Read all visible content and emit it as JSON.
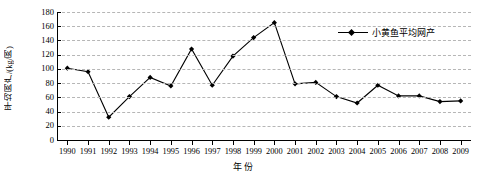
{
  "chart_data": {
    "type": "line",
    "title": "",
    "xlabel": "年份",
    "ylabel": "平均网产/(kg/网)",
    "ylim": [
      0,
      180
    ],
    "ytick_step": 20,
    "yticks": [
      180,
      160,
      140,
      120,
      100,
      80,
      60,
      40,
      20,
      0
    ],
    "grid": true,
    "grid_style": "dashed-horizontal",
    "legend_position": "top-right-inside",
    "marker": "diamond",
    "line_color": "#000000",
    "marker_color": "#000000",
    "grid_color": "#b6b6b6",
    "categories": [
      "1990",
      "1991",
      "1992",
      "1993",
      "1994",
      "1995",
      "1996",
      "1997",
      "1998",
      "1999",
      "2000",
      "2001",
      "2002",
      "2003",
      "2004",
      "2005",
      "2006",
      "2007",
      "2008",
      "2009"
    ],
    "series": [
      {
        "name": "小黄鱼平均网产",
        "values": [
          101,
          96,
          32,
          61,
          88,
          76,
          128,
          77,
          118,
          144,
          165,
          79,
          81,
          61,
          52,
          77,
          62,
          62,
          54,
          55
        ]
      }
    ]
  },
  "legend": {
    "entries": [
      {
        "label": "小黄鱼平均网产"
      }
    ]
  },
  "axes": {
    "y_title": "平均网产/(kg/网)",
    "x_title": "年份"
  }
}
